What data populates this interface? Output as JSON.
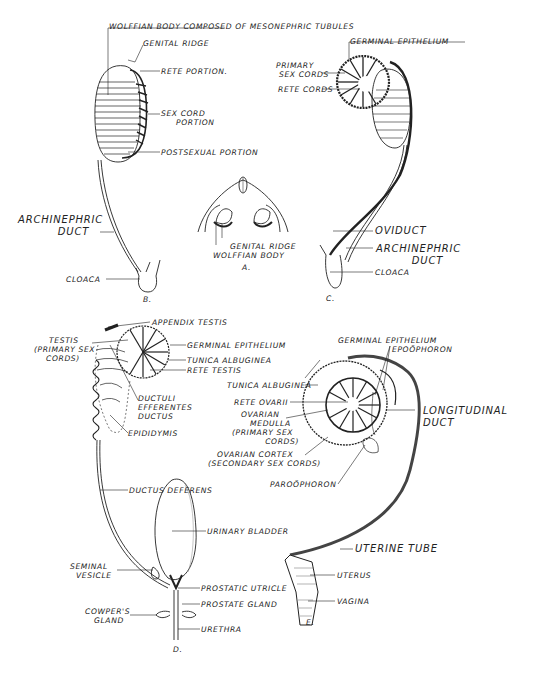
{
  "figure": {
    "panels": [
      {
        "id": "A",
        "caption": "A.",
        "subject": "cross section of embryo, indifferent stage",
        "labels": {
          "genital_ridge": "GENITAL RIDGE",
          "wolffian_body": "WOLFFIAN BODY"
        }
      },
      {
        "id": "B",
        "caption": "B.",
        "subject": "indifferent gonad and mesonephros",
        "labels": {
          "wolffian_body": "WOLFFIAN BODY COMPOSED OF MESONEPHRIC TUBULES",
          "genital_ridge": "GENITAL RIDGE",
          "rete_portion": "RETE PORTION.",
          "sex_cord_portion": "SEX CORD\n     PORTION",
          "postsexual_portion": "POSTSEXUAL PORTION",
          "archinephric_duct": "ARCHINEPHRIC\n          DUCT",
          "cloaca": "CLOACA"
        }
      },
      {
        "id": "C",
        "caption": "C.",
        "subject": "differentiating gonad with oviduct",
        "labels": {
          "germinal_epithelium": "GERMINAL EPITHELIUM",
          "primary_sex_cords": "PRIMARY\n SEX CORDS",
          "rete_cords": "RETE CORDS",
          "oviduct": "OVIDUCT",
          "archinephric_duct": "ARCHINEPHRIC\n         DUCT",
          "cloaca": "CLOACA"
        }
      },
      {
        "id": "D",
        "caption": "D.",
        "subject": "male reproductive tract",
        "labels": {
          "appendix_testis": "APPENDIX TESTIS",
          "testis": "     TESTIS\n(PRIMARY SEX\n    CORDS)",
          "germinal_epithelium": "GERMINAL EPITHELIUM",
          "tunica_albuginea": "TUNICA ALBUGINEA",
          "rete_testis": "RETE TESTIS",
          "ductuli_efferentes": "DUCTULI\nEFFERENTES\nDUCTUS",
          "epididymis": "EPIDIDYMIS",
          "ductus_deferens": "DUCTUS DEFERENS",
          "urinary_bladder": "URINARY BLADDER",
          "seminal_vesicle": "SEMINAL\n  VESICLE",
          "prostatic_utricle": "PROSTATIC UTRICLE",
          "prostate_gland": "PROSTATE GLAND",
          "cowpers_gland": "COWPER'S\n   GLAND",
          "urethra": "URETHRA"
        }
      },
      {
        "id": "E",
        "caption": "E.",
        "subject": "female reproductive tract",
        "labels": {
          "germinal_epithelium": "GERMINAL EPITHELIUM",
          "epoophoron": "EPOÖPHORON",
          "tunica_albuginea": "TUNICA ALBUGINEA",
          "rete_ovarii": "RETE OVARII",
          "ovarian_medulla": "   OVARIAN\n      MEDULLA\n(PRIMARY SEX\n           CORDS)",
          "ovarian_cortex": "   OVARIAN CORTEX\n(SECONDARY SEX CORDS)",
          "longitudinal_duct": "LONGITUDINAL\nDUCT",
          "paroophoron": "PAROÖPHORON",
          "uterine_tube": "UTERINE TUBE",
          "uterus": "UTERUS",
          "vagina": "VAGINA"
        }
      }
    ]
  },
  "colors": {
    "ink": "#222222",
    "paper": "#ffffff",
    "shade": "#888888"
  }
}
